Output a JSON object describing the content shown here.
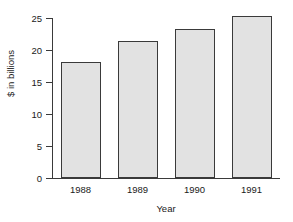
{
  "chart_data": {
    "type": "bar",
    "title": "",
    "xlabel": "Year",
    "ylabel": "$ in billions",
    "categories": [
      "1988",
      "1989",
      "1990",
      "1991"
    ],
    "values": [
      18.2,
      21.4,
      23.3,
      25.3
    ],
    "yticks": [
      "0",
      "5",
      "10",
      "15",
      "20",
      "25"
    ],
    "ytick_values": [
      0,
      5,
      10,
      15,
      20,
      25
    ],
    "ylim": [
      0,
      25
    ],
    "grid": false,
    "legend": false,
    "bar_fill_color": "#e2e2e2",
    "bar_edge_color": "#3a3a3a",
    "axis_color": "#3a3a3a",
    "text_color": "#1a1a1a",
    "background_color": "#ffffff"
  }
}
